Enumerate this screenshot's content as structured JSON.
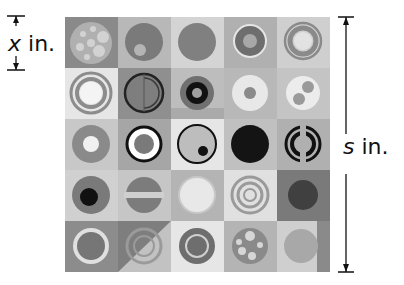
{
  "labels": {
    "tile_var": "x",
    "tile_unit": "in.",
    "side_var": "s",
    "side_unit": "in."
  },
  "grid": {
    "rows": 5,
    "cols": 5,
    "description": "Quilt of 25 square tiles each with circular designs"
  },
  "tiles": [
    {
      "bg": "#8a8a8a",
      "design": "dots-circle"
    },
    {
      "bg": "#b8b8b8",
      "design": "circle-with-small-dot"
    },
    {
      "bg": "#d4d4d4",
      "design": "solid-circle"
    },
    {
      "bg": "#b0b0b0",
      "design": "ring-circle"
    },
    {
      "bg": "#cfcfcf",
      "design": "concentric-rings"
    },
    {
      "bg": "#e6e6e6",
      "design": "double-ring"
    },
    {
      "bg": "#8f8f8f",
      "design": "dark-outline-rings"
    },
    {
      "bg": "#bdbdbd",
      "design": "black-ring-donut"
    },
    {
      "bg": "#b8b8b8",
      "design": "light-ring-dot"
    },
    {
      "bg": "#c4c4c4",
      "design": "two-dots-circle"
    },
    {
      "bg": "#c8c8c8",
      "design": "donut"
    },
    {
      "bg": "#a6a6a6",
      "design": "black-ring-circle"
    },
    {
      "bg": "#e6e6e6",
      "design": "outline-with-dot"
    },
    {
      "bg": "#c0c0c0",
      "design": "solid-black-circle"
    },
    {
      "bg": "#b0b0b0",
      "design": "split-black-rings"
    },
    {
      "bg": "#d0d0d0",
      "design": "circle-black-center"
    },
    {
      "bg": "#c6c6c6",
      "design": "striped-circle"
    },
    {
      "bg": "#b4b4b4",
      "design": "light-circle"
    },
    {
      "bg": "#e0e0e0",
      "design": "triple-rings"
    },
    {
      "bg": "#7a7a7a",
      "design": "dark-fuzzy-circle"
    },
    {
      "bg": "#8c8c8c",
      "design": "light-ring-circle"
    },
    {
      "bg": "#c2c2c2",
      "design": "diagonal-split-rings"
    },
    {
      "bg": "#e6e6e6",
      "design": "ring-dark"
    },
    {
      "bg": "#b4b4b4",
      "design": "dots-circle-2"
    },
    {
      "bg": "#cfcfcf",
      "design": "plain-circle"
    }
  ]
}
